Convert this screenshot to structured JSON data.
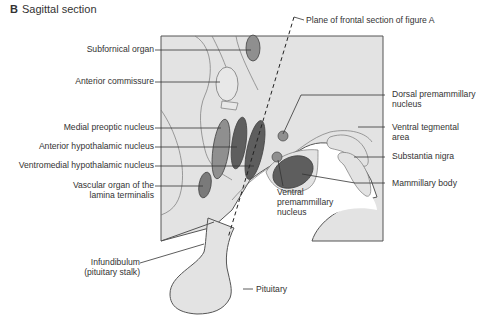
{
  "figure": {
    "panel_letter": "B",
    "title": "Sagittal section",
    "plane_label": "Plane of frontal section of figure A"
  },
  "labels_left": [
    {
      "id": "subfornical-organ",
      "lines": [
        "Subfornical organ"
      ]
    },
    {
      "id": "anterior-commissure",
      "lines": [
        "Anterior commissure"
      ]
    },
    {
      "id": "medial-preoptic-nucleus",
      "lines": [
        "Medial preoptic nucleus"
      ]
    },
    {
      "id": "anterior-hypothalamic-nucleus",
      "lines": [
        "Anterior hypothalamic nucleus"
      ]
    },
    {
      "id": "ventromedial-hypothalamic-nucleus",
      "lines": [
        "Ventromedial hypothalamic nucleus"
      ]
    },
    {
      "id": "vascular-organ-lamina-terminalis",
      "lines": [
        "Vascular organ of the",
        "lamina terminalis"
      ]
    },
    {
      "id": "infundibulum",
      "lines": [
        "Infundibulum",
        "(pituitary stalk)"
      ]
    }
  ],
  "labels_right": [
    {
      "id": "dorsal-premammillary-nucleus",
      "lines": [
        "Dorsal premammillary",
        "nucleus"
      ]
    },
    {
      "id": "ventral-tegmental-area",
      "lines": [
        "Ventral tegmental",
        "area"
      ]
    },
    {
      "id": "substantia-nigra",
      "lines": [
        "Substantia nigra"
      ]
    },
    {
      "id": "mammillary-body",
      "lines": [
        "Mammillary body"
      ]
    },
    {
      "id": "pituitary",
      "lines": [
        "Pituitary"
      ]
    }
  ],
  "labels_center": [
    {
      "id": "ventral-premammillary-nucleus",
      "lines": [
        "Ventral",
        "premammillary",
        "nucleus"
      ]
    }
  ],
  "colors": {
    "tissue_fill": "#e2e2e2",
    "outline": "#555555",
    "light_nucleus": "#8f8f8f",
    "dark_nucleus": "#5e5e5e",
    "white_region": "#ffffff"
  }
}
